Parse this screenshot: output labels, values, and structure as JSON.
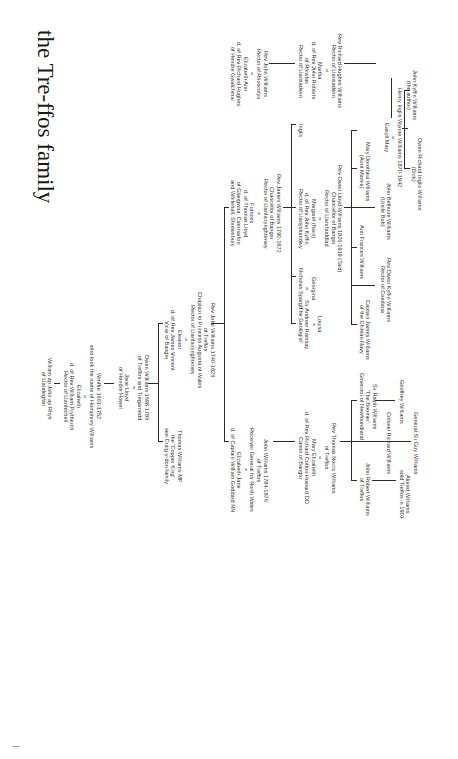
{
  "title": "the Tre-ffos family",
  "nodes": {
    "william": [
      "William ap John ap Rhys",
      "of Llandegfan"
    ],
    "wmffre": [
      "Wmffre 1661-1752",
      "who took the name of Humphrey Williams",
      "=",
      "Elizabeth",
      "d. of Rev William Prytherch",
      "Rector of Llanfechell"
    ],
    "owen1": [
      "Owen Williams 1698-1786",
      "of Treffos and Tregarnedd",
      "=",
      "Jane Lloyd",
      "of Hendre Howel"
    ],
    "thomas_mp": [
      "Thomas Williams MP",
      "the 'Copper King'",
      "see Craig-y-don family"
    ],
    "rev_john_1740": [
      "Rev John Williams 1740-1826",
      "of Treffos",
      "Chaplain to Princess Augusta of Wales",
      "Rector of Llanfairynghornwy",
      "=",
      "Eleanor",
      "d. of Rev James Vincent",
      "Vicar of Bangor"
    ],
    "john_1784": [
      "John Williams 1784-1876",
      "of Treffos",
      "Receiver General for North Wales",
      "=",
      "Elizabeth Jane",
      "d. of Captain William Goddard RN"
    ],
    "rev_james": [
      "Rev James Williams 1790-1872",
      "Chancellor of Bangor",
      "Rector of Llanfairynghornwy",
      "=",
      "Frances",
      "d. of Thomas Lloyd",
      "of Glangwna, Caernarfon",
      "and Whitehall, Shrewsbury"
    ],
    "rev_thomas_nor": [
      "Rev Thomas Norris Williams",
      "of Treffos",
      "=",
      "Mary Elizabeth",
      "d. of Rev Richard Cotton Howard DD",
      "Canon of Bangor"
    ],
    "louisa": [
      "Louisa",
      "=",
      "Sir Andrew Ramsay",
      "'The Geologist'"
    ],
    "georgina": [
      "Georgina",
      "=",
      "Nicholas Spargo"
    ],
    "rev_owen_lloyd": [
      "Rev Owen Lloyd Williams 1826-1919 (Taid)",
      "Chancellor of Bangor",
      "Rector of Llanrhuddlad",
      "=",
      "Margaret (Nain)",
      "d. of Rev John Kyffin",
      "Rector of Llanystumdwy"
    ],
    "inglis": [
      "Inglis"
    ],
    "rev_john_rhos": [
      "Rev John Williams",
      "Rector of Rhoscolyn",
      "=",
      "Elizabeth Ann",
      "d. of Rev Richard Hughes",
      "of Hendre Gwalchmai"
    ],
    "rev_richard_hughes": [
      "Rev Richard Hughes Williams",
      "Rector of Llansadwrn",
      "=",
      "Martha",
      "d. of Rev John Roberts",
      "of Rhiwlas",
      "Rector of Llansadwrn"
    ],
    "john_robert": [
      "John Robert Williams",
      "of Treffos"
    ],
    "alured": [
      "Alured Williams",
      "sold Treffos in 1903"
    ],
    "colonel_richard": [
      "Colonel Richard Williams"
    ],
    "general_guy": [
      "General Sir Guy Williams"
    ],
    "sir_ralph": [
      "Sir Ralph Williams",
      "'The Boomer'",
      "Governor of Newfoundland"
    ],
    "geoffrey": [
      "Geoffrey Williams"
    ],
    "capt_james": [
      "Captain James Williams",
      "of the Chilean Navy"
    ],
    "rev_owen_kyffin": [
      "Rev Owen Kyffin Williams",
      "Rector of Coedana"
    ],
    "ann_frances": [
      "Ann Frances Williams"
    ],
    "john_bethune": [
      "John Bethune Williams",
      "(Uncle Bob)"
    ],
    "mary_dorothea": [
      "Mary Dorothea Williams",
      "(Aunt Mamie)"
    ],
    "henry_inglis": [
      "Henry Inglis Wynne Williams 1870-1942",
      "=",
      "Easylt Mary"
    ],
    "owen_richard": [
      "Owen Richard Inglis Williams",
      "(Dick)"
    ],
    "john_kyffin": [
      "John Kyffin Williams",
      "(the author)"
    ]
  }
}
